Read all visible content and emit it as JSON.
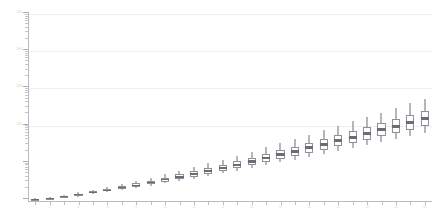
{
  "chart_data": {
    "type": "box",
    "title": "",
    "xlabel": "",
    "ylabel": "",
    "yscale": "log",
    "grid": true,
    "legend": null,
    "ylim": [
      1,
      100000
    ],
    "y_major_ticks": [
      100000,
      10000,
      1000,
      100
    ],
    "y_major_tick_labels": [
      "10^5",
      "10^4",
      "10^3",
      "10^2"
    ],
    "categories": [
      "1",
      "2",
      "3",
      "4",
      "5",
      "6",
      "7",
      "8",
      "9",
      "10",
      "11",
      "12",
      "13",
      "14",
      "15",
      "16",
      "17",
      "18",
      "19",
      "20",
      "21",
      "22",
      "23",
      "24",
      "25",
      "26",
      "27",
      "28"
    ],
    "x_tick_labels": [
      "",
      "2",
      "",
      "4",
      "",
      "6",
      "",
      "8",
      "",
      "10",
      "",
      "12",
      "",
      "14",
      "",
      "16",
      "",
      "18",
      "",
      "20",
      "",
      "22",
      "",
      "24",
      "",
      "26",
      "",
      "28"
    ],
    "boxes": [
      {
        "category": "1",
        "whisker_low": 1.0,
        "q1": 1.0,
        "median": 1.02,
        "q3": 1.05,
        "whisker_high": 1.1
      },
      {
        "category": "2",
        "whisker_low": 1.05,
        "q1": 1.08,
        "median": 1.12,
        "q3": 1.16,
        "whisker_high": 1.22
      },
      {
        "category": "3",
        "whisker_low": 1.14,
        "q1": 1.18,
        "median": 1.24,
        "q3": 1.3,
        "whisker_high": 1.4
      },
      {
        "category": "4",
        "whisker_low": 1.26,
        "q1": 1.32,
        "median": 1.4,
        "q3": 1.48,
        "whisker_high": 1.62
      },
      {
        "category": "5",
        "whisker_low": 1.42,
        "q1": 1.5,
        "median": 1.6,
        "q3": 1.72,
        "whisker_high": 1.9
      },
      {
        "category": "6",
        "whisker_low": 1.6,
        "q1": 1.7,
        "median": 1.84,
        "q3": 2.0,
        "whisker_high": 2.24
      },
      {
        "category": "7",
        "whisker_low": 1.82,
        "q1": 1.95,
        "median": 2.14,
        "q3": 2.35,
        "whisker_high": 2.68
      },
      {
        "category": "8",
        "whisker_low": 2.08,
        "q1": 2.26,
        "median": 2.5,
        "q3": 2.78,
        "whisker_high": 3.24
      },
      {
        "category": "9",
        "whisker_low": 2.4,
        "q1": 2.62,
        "median": 2.95,
        "q3": 3.32,
        "whisker_high": 3.95
      },
      {
        "category": "10",
        "whisker_low": 2.78,
        "q1": 3.06,
        "median": 3.5,
        "q3": 4.0,
        "whisker_high": 4.86
      },
      {
        "category": "11",
        "whisker_low": 3.22,
        "q1": 3.6,
        "median": 4.18,
        "q3": 4.85,
        "whisker_high": 6.05
      },
      {
        "category": "12",
        "whisker_low": 3.76,
        "q1": 4.25,
        "median": 5.02,
        "q3": 5.92,
        "whisker_high": 7.6
      },
      {
        "category": "13",
        "whisker_low": 4.4,
        "q1": 5.05,
        "median": 6.05,
        "q3": 7.26,
        "whisker_high": 9.6
      },
      {
        "category": "14",
        "whisker_low": 5.18,
        "q1": 6.02,
        "median": 7.35,
        "q3": 8.95,
        "whisker_high": 12.2
      },
      {
        "category": "15",
        "whisker_low": 6.1,
        "q1": 7.2,
        "median": 8.95,
        "q3": 11.1,
        "whisker_high": 15.6
      },
      {
        "category": "16",
        "whisker_low": 7.25,
        "q1": 8.65,
        "median": 10.9,
        "q3": 13.8,
        "whisker_high": 20.0
      },
      {
        "category": "17",
        "whisker_low": 8.6,
        "q1": 10.4,
        "median": 13.4,
        "q3": 17.3,
        "whisker_high": 25.8
      },
      {
        "category": "18",
        "whisker_low": 10.2,
        "q1": 12.6,
        "median": 16.5,
        "q3": 21.7,
        "whisker_high": 33.5
      },
      {
        "category": "19",
        "whisker_low": 12.2,
        "q1": 15.3,
        "median": 20.4,
        "q3": 27.4,
        "whisker_high": 43.5
      },
      {
        "category": "20",
        "whisker_low": 14.6,
        "q1": 18.6,
        "median": 25.3,
        "q3": 34.6,
        "whisker_high": 56.8
      },
      {
        "category": "21",
        "whisker_low": 17.5,
        "q1": 22.7,
        "median": 31.5,
        "q3": 43.8,
        "whisker_high": 74.5
      },
      {
        "category": "22",
        "whisker_low": 21.0,
        "q1": 27.8,
        "median": 39.2,
        "q3": 55.6,
        "whisker_high": 98.0
      },
      {
        "category": "23",
        "whisker_low": 25.3,
        "q1": 34.1,
        "median": 49.0,
        "q3": 70.8,
        "whisker_high": 129.0
      },
      {
        "category": "24",
        "whisker_low": 30.5,
        "q1": 41.9,
        "median": 61.3,
        "q3": 90.3,
        "whisker_high": 170.0
      },
      {
        "category": "25",
        "whisker_low": 36.8,
        "q1": 51.5,
        "median": 76.8,
        "q3": 115.0,
        "whisker_high": 225.0
      },
      {
        "category": "26",
        "whisker_low": 44.5,
        "q1": 63.4,
        "median": 96.5,
        "q3": 147.0,
        "whisker_high": 298.0
      },
      {
        "category": "27",
        "whisker_low": 53.8,
        "q1": 78.2,
        "median": 121.0,
        "q3": 188.0,
        "whisker_high": 395.0
      },
      {
        "category": "28",
        "whisker_low": 65.2,
        "q1": 96.5,
        "median": 152.0,
        "q3": 241.0,
        "whisker_high": 525.0
      }
    ],
    "colors": {
      "box_fill": "#ffffff",
      "box_edge": "#8d9097",
      "median": "#6a6d73",
      "whisker": "#6e7177",
      "gridline": "#eceef1",
      "axis": "#b9bcc2",
      "background": "#ffffff"
    }
  }
}
